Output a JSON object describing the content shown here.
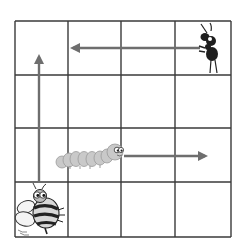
{
  "grid": {
    "rows": 4,
    "cols": 4,
    "x_lines": [
      15,
      68,
      121,
      175,
      231
    ],
    "y_lines": [
      21,
      75,
      128,
      182,
      237
    ],
    "line_color": "#3a3a3a",
    "arrow_color": "#6e6e6e"
  },
  "characters": [
    {
      "name": "bee",
      "cell": {
        "row": 4,
        "col": 1
      },
      "arrow_direction": "up"
    },
    {
      "name": "caterpillar",
      "cell": {
        "row": 3,
        "col": 2
      },
      "arrow_direction": "right"
    },
    {
      "name": "ant",
      "cell": {
        "row": 1,
        "col": 4
      },
      "arrow_direction": "left"
    }
  ],
  "arrows": [
    {
      "id": "bee-arrow",
      "x1": 39,
      "y1": 183,
      "x2": 39,
      "y2": 57
    },
    {
      "id": "caterpillar-arrow",
      "x1": 124,
      "y1": 156,
      "x2": 205,
      "y2": 156
    },
    {
      "id": "ant-arrow",
      "x1": 200,
      "y1": 48,
      "x2": 73,
      "y2": 48
    }
  ]
}
